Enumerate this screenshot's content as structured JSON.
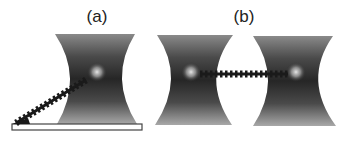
{
  "panels": [
    {
      "label": "(a)",
      "description": "Single optical trap with bead tethered to surface",
      "components": [
        "laser-beam",
        "trapped-bead",
        "tether",
        "substrate"
      ]
    },
    {
      "label": "(b)",
      "description": "Dual optical traps with tether between two beads",
      "components": [
        "laser-beam-left",
        "trapped-bead-left",
        "tether",
        "laser-beam-right",
        "trapped-bead-right"
      ]
    }
  ],
  "colors": {
    "beam_dark": "#2a2a2a",
    "beam_light": "#9a9a9a",
    "bead_glow": "#d8d8d8",
    "tether": "#1a1a1a",
    "substrate_fill": "#ffffff",
    "substrate_stroke": "#444444",
    "background": "#ffffff"
  }
}
